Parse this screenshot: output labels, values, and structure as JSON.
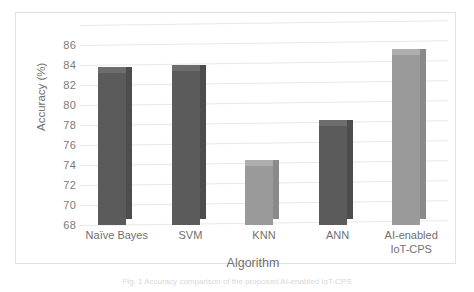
{
  "figure": {
    "caption": "Fig. 1  Accuracy comparison of the proposed AI-enabled IoT-CPS"
  },
  "chart_data": {
    "type": "bar",
    "title": "",
    "subtitle": "",
    "xlabel": "Algorithm",
    "ylabel": "Accuracy (%)",
    "categories": [
      "Naïve Bayes",
      "SVM",
      "KNN",
      "ANN",
      "AI-enabled IoT-CPS"
    ],
    "category_lines": [
      [
        "Naïve Bayes"
      ],
      [
        "SVM"
      ],
      [
        "KNN"
      ],
      [
        "ANN"
      ],
      [
        "AI-enabled",
        "IoT-CPS"
      ]
    ],
    "values": [
      83.2,
      83.4,
      73.9,
      77.9,
      85.0
    ],
    "bar_colors": [
      "#5b5b5b",
      "#5b5b5b",
      "#9a9a9a",
      "#5b5b5b",
      "#9a9a9a"
    ],
    "ylim": [
      68,
      86
    ],
    "yticks": [
      68,
      70,
      72,
      74,
      76,
      78,
      80,
      82,
      84,
      86
    ],
    "grid": true,
    "legend": "none",
    "style": "3d-column"
  },
  "colors": {
    "bar_dark": "#5b5b5b",
    "bar_light": "#9a9a9a",
    "gridline": "#e8e8e8",
    "frame": "#e2e2e2",
    "axis_text": "#7a7a7a"
  }
}
